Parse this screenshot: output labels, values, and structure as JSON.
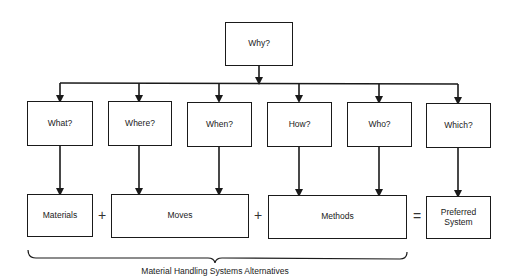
{
  "diagram": {
    "root": {
      "label": "Why?"
    },
    "questions": [
      {
        "id": "what",
        "label": "What?"
      },
      {
        "id": "where",
        "label": "Where?"
      },
      {
        "id": "when",
        "label": "When?"
      },
      {
        "id": "how",
        "label": "How?"
      },
      {
        "id": "who",
        "label": "Who?"
      },
      {
        "id": "which",
        "label": "Which?"
      }
    ],
    "outcomes": [
      {
        "id": "materials",
        "label": "Materials",
        "from": [
          "what"
        ]
      },
      {
        "id": "moves",
        "label": "Moves",
        "from": [
          "where",
          "when"
        ]
      },
      {
        "id": "methods",
        "label": "Methods",
        "from": [
          "how",
          "who"
        ]
      },
      {
        "id": "preferred-system",
        "label": "Preferred System",
        "from": [
          "which"
        ]
      }
    ],
    "operators": [
      "+",
      "+",
      "="
    ],
    "brace_caption": "Material Handling Systems Alternatives",
    "colors": {
      "line": "#1a1a1a",
      "background": "#ffffff"
    }
  }
}
